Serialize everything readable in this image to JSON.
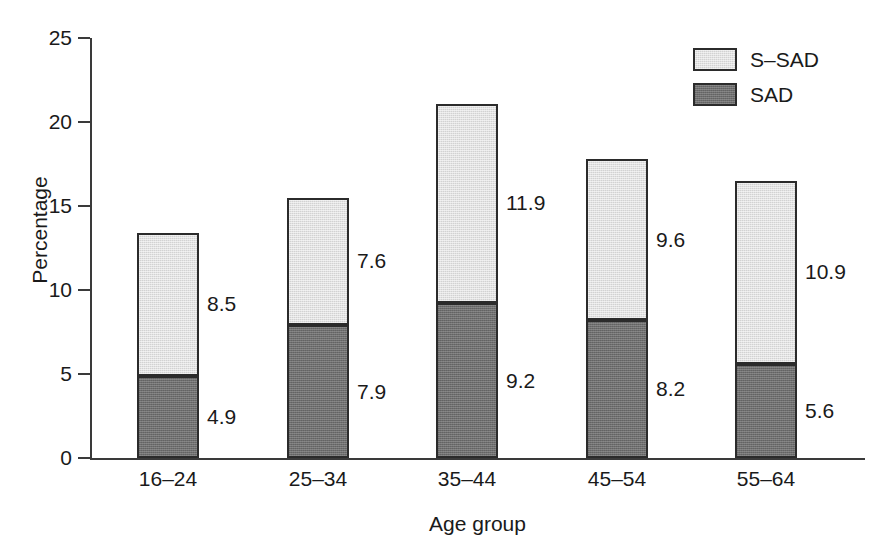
{
  "chart_data": {
    "type": "bar",
    "title": "",
    "subtitle": "",
    "stacked": true,
    "orientation": "vertical",
    "xlabel": "Age group",
    "ylabel": "Percentage",
    "categories": [
      "16–24",
      "25–34",
      "35–44",
      "45–54",
      "55–64"
    ],
    "series": [
      {
        "name": "SAD",
        "values": [
          4.9,
          7.9,
          9.2,
          8.2,
          5.6
        ],
        "color": "#6e6e6e"
      },
      {
        "name": "S–SAD",
        "values": [
          8.5,
          7.6,
          11.9,
          9.6,
          10.9
        ],
        "color": "#d2d2d2"
      }
    ],
    "totals": [
      13.4,
      15.5,
      21.1,
      17.8,
      16.5
    ],
    "ylim": [
      0,
      25
    ],
    "yticks": [
      0,
      5,
      10,
      15,
      20,
      25
    ],
    "ytick_labels": [
      "0",
      "5",
      "10",
      "15",
      "20",
      "25"
    ],
    "grid": false,
    "legend_position": "top-right",
    "data_labels": "right-of-bar"
  },
  "axes": {
    "y_title": "Percentage",
    "x_title": "Age group",
    "y_ticks": [
      {
        "value": 25,
        "label": "25"
      },
      {
        "value": 20,
        "label": "20"
      },
      {
        "value": 15,
        "label": "15"
      },
      {
        "value": 10,
        "label": "10"
      },
      {
        "value": 5,
        "label": "5"
      },
      {
        "value": 0,
        "label": "0"
      }
    ]
  },
  "legend": {
    "items": [
      {
        "label": "S–SAD",
        "swatch": "light-gray"
      },
      {
        "label": "SAD",
        "swatch": "dark-gray"
      }
    ]
  },
  "bars": [
    {
      "category": "16–24",
      "top_label": "8.5",
      "top_value": 8.5,
      "bottom_label": "4.9",
      "bottom_value": 4.9,
      "total": 13.4
    },
    {
      "category": "25–34",
      "top_label": "7.6",
      "top_value": 7.6,
      "bottom_label": "7.9",
      "bottom_value": 7.9,
      "total": 15.5
    },
    {
      "category": "35–44",
      "top_label": "11.9",
      "top_value": 11.9,
      "bottom_label": "9.2",
      "bottom_value": 9.2,
      "total": 21.1
    },
    {
      "category": "45–54",
      "top_label": "9.6",
      "top_value": 9.6,
      "bottom_label": "8.2",
      "bottom_value": 8.2,
      "total": 17.8
    },
    {
      "category": "55–64",
      "top_label": "10.9",
      "top_value": 10.9,
      "bottom_label": "5.6",
      "bottom_value": 5.6,
      "total": 16.5
    }
  ],
  "colors": {
    "s_sad": "#d2d2d2",
    "sad": "#6e6e6e",
    "outline": "#2b2b2b",
    "axis": "#3a3a3a",
    "text": "#1a1a1a",
    "background": "#ffffff"
  }
}
